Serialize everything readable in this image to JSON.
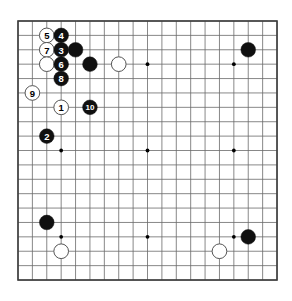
{
  "diagram": {
    "type": "go-board-diagram",
    "board_size": 19,
    "board": {
      "origin_x": 18,
      "origin_y": 21,
      "spacing": 14.39,
      "line_color": "#6a6a6a",
      "border_color": "#3c3c3c",
      "background_color": "#ffffff",
      "star_point_color": "#000000"
    },
    "star_points": [
      {
        "col": 4,
        "row": 4
      },
      {
        "col": 10,
        "row": 4
      },
      {
        "col": 16,
        "row": 4
      },
      {
        "col": 4,
        "row": 10
      },
      {
        "col": 10,
        "row": 10
      },
      {
        "col": 16,
        "row": 10
      },
      {
        "col": 4,
        "row": 16
      },
      {
        "col": 10,
        "row": 16
      },
      {
        "col": 16,
        "row": 16
      }
    ],
    "colors": {
      "black_stone": "#101010",
      "white_stone": "#ffffff",
      "white_stone_border": "#555555",
      "black_label_text": "#ffffff",
      "white_label_text": "#000000"
    },
    "stones": [
      {
        "id": "w5",
        "color": "white",
        "label": "5",
        "col": 3,
        "row": 2
      },
      {
        "id": "b4",
        "color": "black",
        "label": "4",
        "col": 4,
        "row": 2
      },
      {
        "id": "w7",
        "color": "white",
        "label": "7",
        "col": 3,
        "row": 3
      },
      {
        "id": "b3",
        "color": "black",
        "label": "3",
        "col": 4,
        "row": 3
      },
      {
        "id": "b-d16",
        "color": "black",
        "label": "",
        "col": 5,
        "row": 3
      },
      {
        "id": "w-c15",
        "color": "white",
        "label": "",
        "col": 3,
        "row": 4
      },
      {
        "id": "b6",
        "color": "black",
        "label": "6",
        "col": 4,
        "row": 4
      },
      {
        "id": "b-e15",
        "color": "black",
        "label": "",
        "col": 6,
        "row": 4
      },
      {
        "id": "w-g15",
        "color": "white",
        "label": "",
        "col": 8,
        "row": 4
      },
      {
        "id": "b-q16",
        "color": "black",
        "label": "",
        "col": 17,
        "row": 3
      },
      {
        "id": "b8",
        "color": "black",
        "label": "8",
        "col": 4,
        "row": 5
      },
      {
        "id": "w9",
        "color": "white",
        "label": "9",
        "col": 2,
        "row": 6
      },
      {
        "id": "w1",
        "color": "white",
        "label": "1",
        "col": 4,
        "row": 7
      },
      {
        "id": "b10",
        "color": "black",
        "label": "10",
        "col": 6,
        "row": 7
      },
      {
        "id": "b2",
        "color": "black",
        "label": "2",
        "col": 3,
        "row": 9
      },
      {
        "id": "b-c6",
        "color": "black",
        "label": "",
        "col": 3,
        "row": 15
      },
      {
        "id": "b-q6",
        "color": "black",
        "label": "",
        "col": 17,
        "row": 16
      },
      {
        "id": "w-d4",
        "color": "white",
        "label": "",
        "col": 4,
        "row": 17
      },
      {
        "id": "w-o4",
        "color": "white",
        "label": "",
        "col": 15,
        "row": 17
      }
    ]
  }
}
